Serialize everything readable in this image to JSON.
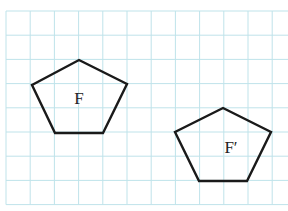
{
  "figure": {
    "type": "grid-transformation-diagram",
    "grid": {
      "color": "#bfe3ea",
      "origin_x": 6,
      "origin_y": 11,
      "spacing": 24.2,
      "cols": 12,
      "rows": 8
    },
    "shapes": [
      {
        "name": "F",
        "label": "F",
        "points": [
          [
            79,
            60
          ],
          [
            127,
            84
          ],
          [
            103,
            133
          ],
          [
            55,
            133
          ],
          [
            32,
            85
          ]
        ],
        "label_pos": [
          79,
          104
        ],
        "stroke": "#1a1a1a"
      },
      {
        "name": "F-prime",
        "label": "F′",
        "points": [
          [
            223,
            108
          ],
          [
            271,
            132
          ],
          [
            247,
            181
          ],
          [
            199,
            181
          ],
          [
            175,
            132
          ]
        ],
        "label_pos": [
          231,
          153
        ],
        "stroke": "#1a1a1a"
      }
    ]
  }
}
